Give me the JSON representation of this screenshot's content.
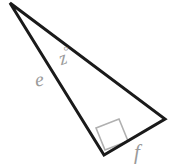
{
  "figure": {
    "kind": "right-triangle-diagram",
    "background_color": "#ffffff",
    "stroke_color": "#1a1a1a",
    "label_color": "#9a9a9a",
    "right_angle_marker_color": "#b0b0b0",
    "stroke_width": 3,
    "vertices": {
      "apex": {
        "name": "apex-vertex",
        "x": 10,
        "y": 3
      },
      "right": {
        "name": "right-vertex",
        "x": 165,
        "y": 119
      },
      "bottom": {
        "name": "bottom-vertex",
        "x": 104,
        "y": 155
      }
    },
    "polygon_points": "10,3 165,119 104,155",
    "right_angle": {
      "at_vertex": "bottom",
      "marker_points": "96,128 119,119 128,141 105,150",
      "is_marked": true
    },
    "labels": {
      "angle_z": "z",
      "angle_z_degree_sign": "°",
      "side_e": "e",
      "side_f": "f"
    },
    "label_meanings": {
      "angle_z": "interior angle at the apex, measured in degrees",
      "side_e": "side from apex to bottom-right-angle vertex",
      "side_f": "side from bottom-right-angle vertex to right vertex"
    }
  }
}
